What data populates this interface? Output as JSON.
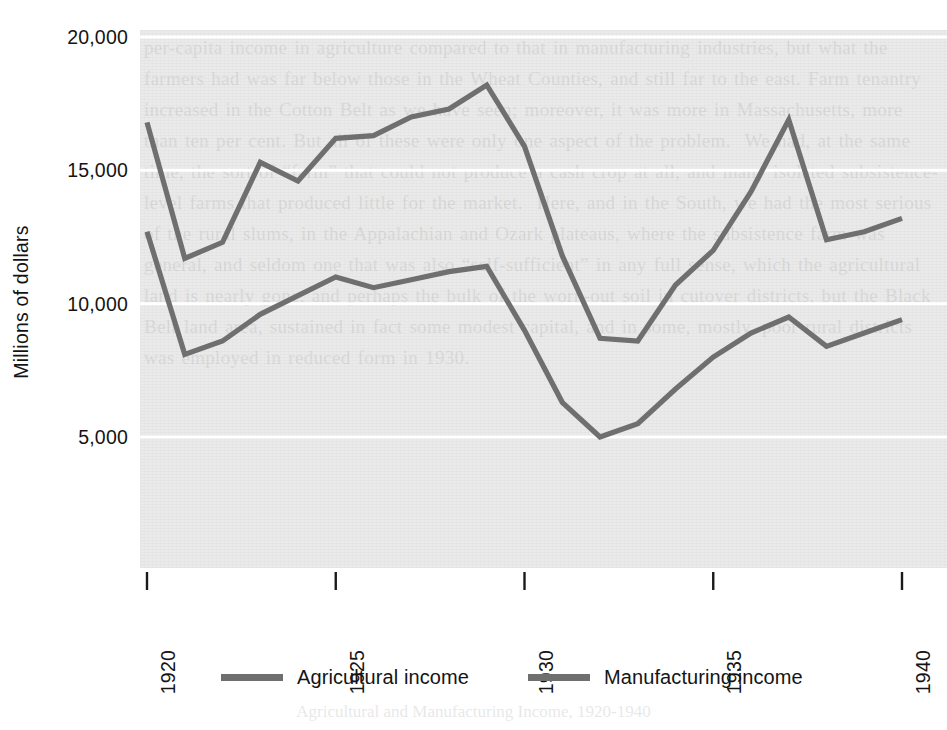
{
  "figure": {
    "background_color": "#ffffff",
    "plot_background_color": "#eaeaea",
    "gridline_color": "#ffffff",
    "line_color": "#6f6f6f",
    "text_color": "#141414",
    "ghost_text": "per-capita income in agriculture compared to that in manufacturing industries, but what the farmers had was far below those in the Wheat Counties, and still far to the east. Farm tenantry increased in the Cotton Belt as we have seen; moreover, it was more in Massachusetts, more than ten per cent. But all of these were only one aspect of the problem.  We had, at the same time, the sort of “farm” that could not produce a cash crop at all, and many isolated subsistence-level farms that produced little for the market.  Here, and in the South, we had the most serious of the rural slums, in the Appalachian and Ozark plateaus, where the subsistence farm was general, and seldom one that was also “self-sufficient” in any full sense, which the agricultural land is nearly gone, and perhaps the bulk of the worn-out soil in cutover districts, but the Black Belt land area, sustained in fact some modest capital, and in some, mostly, poor rural districts was employed in reduced form in 1930."
  },
  "chart_data": {
    "type": "line",
    "title": "",
    "xlabel": "",
    "ylabel": "Millions of dollars",
    "x": [
      1920,
      1921,
      1922,
      1923,
      1924,
      1925,
      1926,
      1927,
      1928,
      1929,
      1930,
      1931,
      1932,
      1933,
      1934,
      1935,
      1936,
      1937,
      1938,
      1939,
      1940
    ],
    "xlim": [
      1920,
      1940
    ],
    "ylim": [
      2900,
      21100
    ],
    "grid": true,
    "grid_axis": "y",
    "legend_position": "below",
    "xticks": [
      1920,
      1925,
      1930,
      1935,
      1940
    ],
    "xtick_labels": [
      "1920",
      "1925",
      "1930",
      "1935",
      "1940"
    ],
    "xtick_rotation": -90,
    "yticks": [
      5000,
      10000,
      15000,
      20000
    ],
    "ytick_labels": [
      "5,000",
      "10,000",
      "15,000",
      "20,000"
    ],
    "series": [
      {
        "name": "Agricultural income",
        "color": "#6f6f6f",
        "values": [
          12700,
          8100,
          8600,
          9600,
          10300,
          11000,
          10600,
          10900,
          11200,
          11400,
          9000,
          6300,
          5000,
          5500,
          6800,
          8000,
          8900,
          9500,
          8400,
          8900,
          9400
        ]
      },
      {
        "name": "Manufacturing income",
        "color": "#6f6f6f",
        "values": [
          16800,
          11700,
          12300,
          15300,
          14600,
          16200,
          16300,
          17000,
          17300,
          18200,
          15900,
          11800,
          8700,
          8600,
          10700,
          12000,
          14200,
          16900,
          12400,
          12700,
          13200
        ]
      }
    ]
  },
  "legend": {
    "items": [
      {
        "label": "Agricultural income"
      },
      {
        "label": "Manufacturing income"
      }
    ]
  },
  "caption_ghost": "Agricultural and Manufacturing Income, 1920-1940"
}
